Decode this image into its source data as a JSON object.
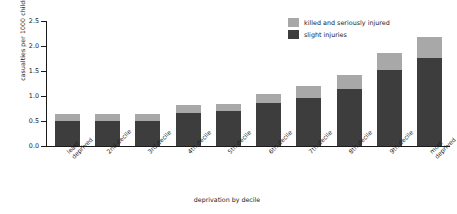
{
  "chart_data": {
    "type": "bar",
    "stacked": true,
    "title": "",
    "xlabel": "deprivation by decile",
    "ylabel": "casualties per 1000 children",
    "ylim": [
      0,
      2.5
    ],
    "yticks": [
      "0.0",
      "0.5",
      "1.0",
      "1.5",
      "2.0",
      "2.5"
    ],
    "grid": false,
    "legend_position": "top-right",
    "categories": [
      "least deprived",
      "2nd decile",
      "3rd decile",
      "4th decile",
      "5th decile",
      "6th decile",
      "7th decile",
      "8th decile",
      "9th decile",
      "most deprived"
    ],
    "series": [
      {
        "name": "slight injuries",
        "color": "#3d3d3d",
        "values": [
          0.5,
          0.51,
          0.5,
          0.66,
          0.7,
          0.86,
          0.96,
          1.14,
          1.52,
          1.76
        ]
      },
      {
        "name": "killed and seriously injured",
        "color": "#a8a8a8",
        "values": [
          0.14,
          0.14,
          0.15,
          0.16,
          0.15,
          0.19,
          0.25,
          0.28,
          0.34,
          0.42
        ]
      }
    ],
    "totals": [
      0.64,
      0.65,
      0.65,
      0.82,
      0.85,
      1.05,
      1.21,
      1.42,
      1.86,
      2.18
    ]
  },
  "legend": {
    "items": [
      {
        "label": "killed and seriously injured",
        "color": "#a8a8a8"
      },
      {
        "label": "slight injuries",
        "color": "#3d3d3d"
      }
    ]
  },
  "axes": {
    "y_title": "casualties per 1000 children",
    "x_title": "deprivation by decile"
  }
}
